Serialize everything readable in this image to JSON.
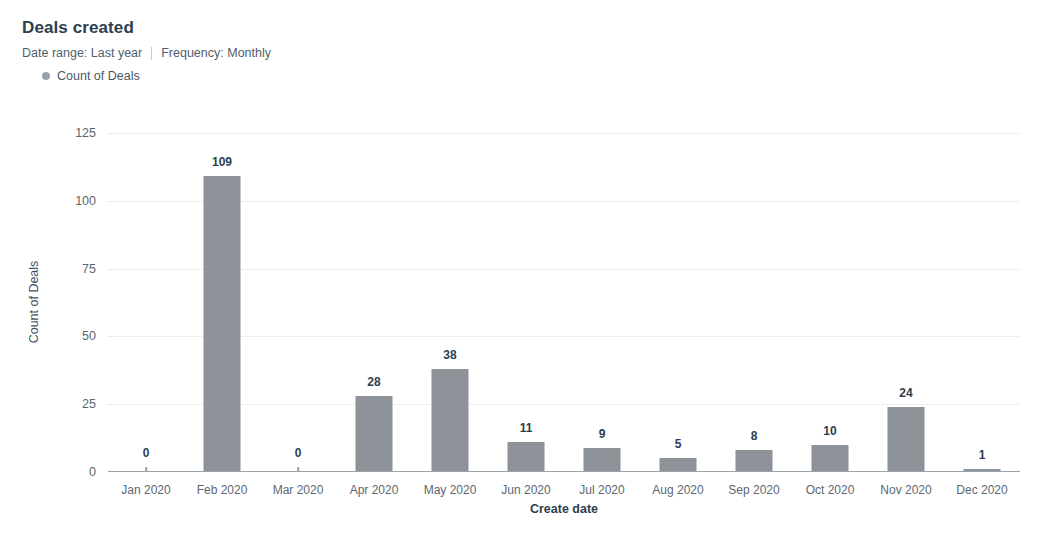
{
  "header": {
    "title": "Deals created",
    "date_range": "Date range: Last year",
    "frequency": "Frequency: Monthly",
    "legend_label": "Count of Deals"
  },
  "colors": {
    "bar": "#8d9399",
    "legend_dot": "#99a3ad",
    "gridline": "#dcdcdc",
    "axis": "#9aa3ab",
    "title_text": "#2d3e50",
    "tick_text": "#5b6770",
    "background": "#ffffff"
  },
  "chart_data": {
    "type": "bar",
    "title": "Deals created",
    "xlabel": "Create date",
    "ylabel": "Count of Deals",
    "categories": [
      "Jan 2020",
      "Feb 2020",
      "Mar 2020",
      "Apr 2020",
      "May 2020",
      "Jun 2020",
      "Jul 2020",
      "Aug 2020",
      "Sep 2020",
      "Oct 2020",
      "Nov 2020",
      "Dec 2020"
    ],
    "values": [
      0,
      109,
      0,
      28,
      38,
      11,
      9,
      5,
      8,
      10,
      24,
      1
    ],
    "series": [
      {
        "name": "Count of Deals",
        "values": [
          0,
          109,
          0,
          28,
          38,
          11,
          9,
          5,
          8,
          10,
          24,
          1
        ]
      }
    ],
    "yticks": [
      0,
      25,
      50,
      75,
      100,
      125
    ],
    "ytick_labels": [
      "0",
      "25",
      "50",
      "75",
      "100",
      "125"
    ],
    "ylim": [
      0,
      125
    ],
    "grid": true,
    "grid_style": "dotted-horizontal",
    "legend_position": "top-left",
    "data_labels": true
  }
}
